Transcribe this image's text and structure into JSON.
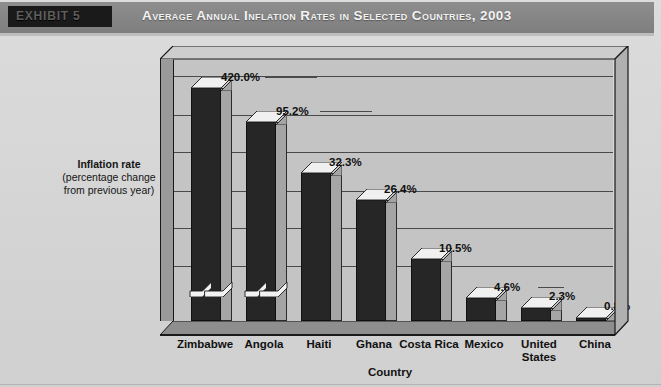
{
  "header": {
    "exhibit_label": "EXHIBIT 5",
    "title": "Average Annual Inflation Rates in Selected Countries, 2003"
  },
  "axis": {
    "ylabel_line1": "Inflation rate",
    "ylabel_line2": "(percentage change",
    "ylabel_line3": "from previous year)",
    "xlabel": "Country"
  },
  "colors": {
    "header_bar": "#878787",
    "exhibit_box": "#1a1a1a",
    "bar_front": "#262626",
    "bar_side": "#a5a5a5",
    "bar_top": "#f0f0f0",
    "plot_bg": "#c4c4c4",
    "page_bg": "#d4d4d4",
    "gridline": "#4a4a4a",
    "floor": "#8e8e8e"
  },
  "chart_data": {
    "type": "bar",
    "title": "Average Annual Inflation Rates in Selected Countries, 2003",
    "xlabel": "Country",
    "ylabel": "Inflation rate (percentage change from previous year)",
    "categories": [
      "Zimbabwe",
      "Angola",
      "Haiti",
      "Ghana",
      "Costa Rica",
      "Mexico",
      "United States",
      "China"
    ],
    "values": [
      420.0,
      95.2,
      32.3,
      26.4,
      10.5,
      4.6,
      2.3,
      0.8
    ],
    "data_labels": [
      "420.0%",
      "95.2%",
      "32.3%",
      "26.4%",
      "10.5%",
      "4.6%",
      "2.3%",
      "0.8%"
    ],
    "axis_break": true,
    "axis_break_categories": [
      "Zimbabwe",
      "Angola"
    ],
    "grid": true,
    "gridlines": 6,
    "legend": "none",
    "ylim": [
      0,
      40
    ],
    "note": "Zimbabwe and Angola bars are drawn with an axis break; their plotted heights are truncated relative to their true values."
  },
  "bars": [
    {
      "label": "Zimbabwe",
      "value_label": "420.0%",
      "h_pct": 93.0,
      "x": 18,
      "w": 30,
      "lab_dx": 30,
      "lab_dy": -18,
      "leader": 52,
      "brk": true
    },
    {
      "label": "Angola",
      "value_label": "95.2%",
      "h_pct": 80.0,
      "x": 73,
      "w": 30,
      "lab_dx": 30,
      "lab_dy": -18,
      "leader": 52,
      "brk": true
    },
    {
      "label": "Haiti",
      "value_label": "32.3%",
      "h_pct": 60.5,
      "x": 128,
      "w": 30,
      "lab_dx": 28,
      "lab_dy": -18,
      "leader": 0,
      "brk": false
    },
    {
      "label": "Ghana",
      "value_label": "26.4%",
      "h_pct": 50.5,
      "x": 183,
      "w": 30,
      "lab_dx": 28,
      "lab_dy": -18,
      "leader": 0,
      "brk": false
    },
    {
      "label": "Costa Rica",
      "value_label": "10.5%",
      "h_pct": 28.0,
      "x": 238,
      "w": 30,
      "lab_dx": 28,
      "lab_dy": -18,
      "leader": 0,
      "brk": false
    },
    {
      "label": "Mexico",
      "value_label": "4.6%",
      "h_pct": 13.0,
      "x": 293,
      "w": 30,
      "lab_dx": 28,
      "lab_dy": -18,
      "leader": 26,
      "brk": false
    },
    {
      "label": "United States",
      "value_label": "2.3%",
      "h_pct": 9.0,
      "x": 348,
      "w": 30,
      "lab_dx": 28,
      "lab_dy": -17,
      "leader": 0,
      "brk": false
    },
    {
      "label": "China",
      "value_label": "0.8%",
      "h_pct": 5.5,
      "x": 403,
      "w": 30,
      "lab_dx": 28,
      "lab_dy": -17,
      "leader": 0,
      "brk": false
    }
  ],
  "categories_layout": [
    {
      "label": "Zimbabwe",
      "x": 6,
      "w": 78
    },
    {
      "label": "Angola",
      "x": 68,
      "w": 72
    },
    {
      "label": "Haiti",
      "x": 128,
      "w": 62
    },
    {
      "label": "Ghana",
      "x": 182,
      "w": 64
    },
    {
      "label": "Costa Rica",
      "x": 238,
      "w": 62
    },
    {
      "label": "Mexico",
      "x": 292,
      "w": 64
    },
    {
      "label": "United States",
      "x": 346,
      "w": 66
    },
    {
      "label": "China",
      "x": 404,
      "w": 62
    }
  ]
}
